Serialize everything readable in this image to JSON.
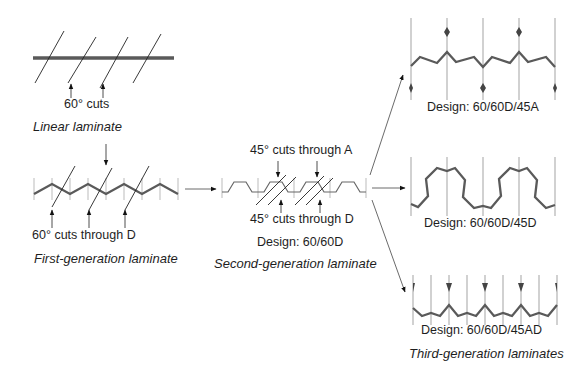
{
  "linear": {
    "cut_label": "60° cuts",
    "caption": "Linear laminate"
  },
  "first_gen": {
    "cut_label": "60° cuts through D",
    "caption": "First-generation laminate"
  },
  "second_gen": {
    "top_label": "45° cuts through A",
    "bottom_label": "45° cuts through D",
    "design": "Design: 60/60D",
    "caption": "Second-generation laminate"
  },
  "third_gen": {
    "designs": [
      "Design: 60/60D/45A",
      "Design: 60/60D/45D",
      "Design: 60/60D/45AD"
    ],
    "caption": "Third-generation laminates"
  },
  "colors": {
    "laminate_line": "#5a5a5a",
    "thin_line": "#333333",
    "background": "#ffffff"
  }
}
